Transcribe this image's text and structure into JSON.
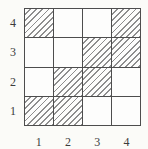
{
  "figure": {
    "type": "hatched-grid-diagram",
    "rows": 4,
    "cols": 4,
    "y_labels_top_to_bottom": [
      "4",
      "3",
      "2",
      "1"
    ],
    "x_labels_left_to_right": [
      "1",
      "2",
      "3",
      "4"
    ],
    "hatch_style": "diagonal-forward-slash",
    "hatched_cells_rows_top_to_bottom": [
      [
        1,
        0,
        0,
        1
      ],
      [
        0,
        0,
        1,
        1
      ],
      [
        0,
        1,
        1,
        0
      ],
      [
        1,
        1,
        0,
        0
      ]
    ],
    "colors": {
      "grid_line": "#4d4d4d",
      "hatch_line": "#8e8e8e",
      "cell_fill": "#fdfdfc",
      "background": "#fbfbf8",
      "label_text": "#3c3c3c"
    }
  },
  "chart_data": {
    "type": "heatmap",
    "title": "",
    "xlabel": "",
    "ylabel": "",
    "x_tick_labels": [
      "1",
      "2",
      "3",
      "4"
    ],
    "y_tick_labels_bottom_to_top": [
      "1",
      "2",
      "3",
      "4"
    ],
    "values_rows_top_to_bottom": [
      [
        1,
        0,
        0,
        1
      ],
      [
        0,
        0,
        1,
        1
      ],
      [
        0,
        1,
        1,
        0
      ],
      [
        1,
        1,
        0,
        0
      ]
    ],
    "value_encoding": "1 = hatched cell, 0 = empty cell",
    "grid": true,
    "legend_position": "none"
  }
}
